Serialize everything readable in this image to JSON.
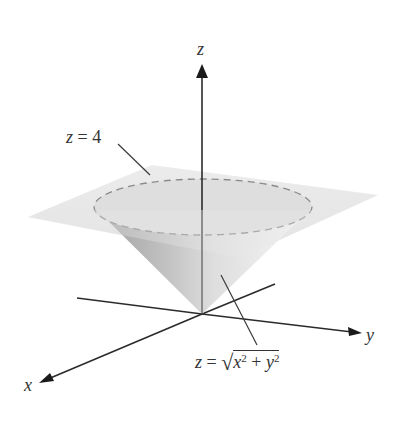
{
  "figure": {
    "axes": {
      "x": {
        "label": "x"
      },
      "y": {
        "label": "y"
      },
      "z": {
        "label": "z"
      }
    },
    "annotations": {
      "plane": {
        "lhs": "z",
        "eq": " = ",
        "rhs": "4"
      },
      "cone": {
        "lhs": "z",
        "eq": " = ",
        "sqrt": "√",
        "x": "x",
        "x_exp": "2",
        "plus": " + ",
        "y": "y",
        "y_exp": "2"
      }
    },
    "colors": {
      "axis": "#2b2b2b",
      "plane_fill": "#e6e6e6",
      "ellipse_fill": "#dcdcdc",
      "ellipse_dash": "#8a8a8a",
      "cone_dark": "#a8a8a8",
      "cone_light": "#efefef",
      "text": "#333333"
    }
  }
}
